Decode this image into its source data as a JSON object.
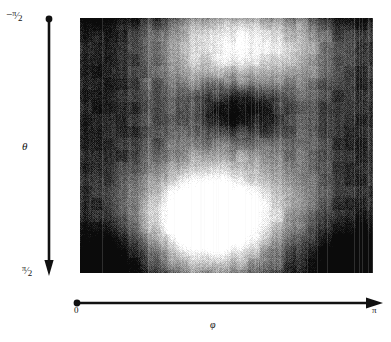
{
  "figure": {
    "type": "heatmap-figure",
    "background_color": "#ffffff",
    "ink_color": "#111111"
  },
  "axes": {
    "vertical": {
      "name": "theta-axis",
      "symbol": "θ",
      "direction": "downward",
      "start_label": "−π/2",
      "start_label_parts": {
        "sign": "−",
        "num": "π",
        "slash": "⁄",
        "den": "2"
      },
      "end_label": "π/2",
      "end_label_parts": {
        "sign": "",
        "num": "π",
        "slash": "⁄",
        "den": "2"
      },
      "range": [
        -1.5707963,
        1.5707963
      ],
      "marker_start": "dot",
      "marker_end": "arrow"
    },
    "horizontal": {
      "name": "phi-axis",
      "symbol": "φ",
      "direction": "rightward",
      "start_label": "0",
      "end_label": "π",
      "range": [
        0,
        3.1415927
      ],
      "marker_start": "dot",
      "marker_end": "arrow"
    }
  },
  "chart_data": {
    "type": "heatmap",
    "title": "",
    "xlabel": "φ",
    "ylabel": "θ",
    "xlim": [
      0,
      3.1415927
    ],
    "ylim": [
      -1.5707963,
      1.5707963
    ],
    "xtick_labels": [
      "0",
      "π"
    ],
    "ytick_labels": [
      "−π/2",
      "π/2"
    ],
    "grid": false,
    "legend": "none",
    "colormap": "grayscale",
    "colormap_low": "#0b0b0b",
    "colormap_high": "#ffffff",
    "value_range": [
      0.0,
      1.0
    ],
    "noise": {
      "texture": "dithered-halftone",
      "amplitude": 0.17,
      "vertical_streaks": true,
      "streak_amplitude": 0.09,
      "block_quantization": 12
    },
    "features": [
      {
        "name": "bright-top-lobe",
        "kind": "gaussian-blob",
        "polarity": "bright",
        "cx": 0.56,
        "cy": 0.1,
        "sx": 0.2,
        "sy": 0.13,
        "amplitude": 0.62
      },
      {
        "name": "dark-core-upper-center",
        "kind": "gaussian-blob",
        "polarity": "dark",
        "cx": 0.545,
        "cy": 0.355,
        "sx": 0.115,
        "sy": 0.085,
        "amplitude": 0.58
      },
      {
        "name": "bright-central-square-outer",
        "kind": "gaussian-blob",
        "polarity": "bright",
        "cx": 0.455,
        "cy": 0.765,
        "sx": 0.235,
        "sy": 0.165,
        "amplitude": 0.48
      },
      {
        "name": "bright-central-square-inner",
        "kind": "gaussian-blob",
        "polarity": "bright",
        "cx": 0.445,
        "cy": 0.785,
        "sx": 0.13,
        "sy": 0.1,
        "amplitude": 0.72
      },
      {
        "name": "bright-core-hotspot",
        "kind": "gaussian-blob",
        "polarity": "bright",
        "cx": 0.44,
        "cy": 0.79,
        "sx": 0.06,
        "sy": 0.052,
        "amplitude": 0.85
      },
      {
        "name": "dark-left-band",
        "kind": "vertical-band",
        "polarity": "dark",
        "cx": 0.085,
        "sx": 0.115,
        "amplitude": 0.3
      },
      {
        "name": "dark-right-band",
        "kind": "vertical-band",
        "polarity": "dark",
        "cx": 0.945,
        "sx": 0.105,
        "amplitude": 0.3
      },
      {
        "name": "dark-bottom-left-corner",
        "kind": "gaussian-blob",
        "polarity": "dark",
        "cx": 0.075,
        "cy": 0.955,
        "sx": 0.115,
        "sy": 0.095,
        "amplitude": 0.45
      },
      {
        "name": "dark-bottom-right-corner",
        "kind": "gaussian-blob",
        "polarity": "dark",
        "cx": 0.905,
        "cy": 0.95,
        "sx": 0.18,
        "sy": 0.11,
        "amplitude": 0.45
      },
      {
        "name": "mid-gray-background",
        "kind": "uniform",
        "polarity": "mid",
        "amplitude": 0.4
      }
    ],
    "row_profile_hint": "dark top rim, bright upper lobe, dark mid core, bright lower square, dark bottom corners",
    "background_level": 0.4
  }
}
